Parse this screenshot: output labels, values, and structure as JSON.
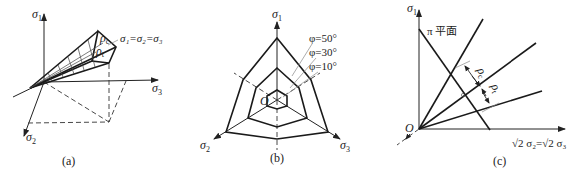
{
  "panels": [
    {
      "id": "a",
      "caption": "(a)",
      "axes": {
        "x1": "σ",
        "x1_sub": "1",
        "x2": "σ",
        "x2_sub": "2",
        "x3": "σ",
        "x3_sub": "3"
      },
      "labels": {
        "hydrostatic": "σ₁=σ₂=σ₃",
        "rho_c": "ρ",
        "rho_c_sub": "c",
        "rho_t": "ρ",
        "rho_t_sub": "t"
      }
    },
    {
      "id": "b",
      "caption": "(b)",
      "axes": {
        "x1": "σ",
        "x1_sub": "1",
        "x2": "σ",
        "x2_sub": "2",
        "x3": "σ",
        "x3_sub": "3"
      },
      "origin": "O",
      "friction_angles": [
        "φ=50°",
        "φ=30°",
        "φ=10°"
      ]
    },
    {
      "id": "c",
      "caption": "(c)",
      "axes": {
        "y": "σ",
        "y_sub": "1",
        "x": "√2 σ₂=√2 σ₃"
      },
      "origin": "O",
      "plane_label": "π 平面",
      "labels": {
        "rho_c": "ρ",
        "rho_c_sub": "c",
        "rho_t": "ρ",
        "rho_t_sub": "t"
      }
    }
  ],
  "colors": {
    "line": "#1a1a1a",
    "background": "#ffffff"
  }
}
